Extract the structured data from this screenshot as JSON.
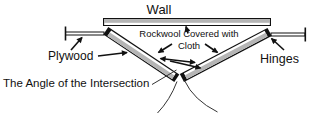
{
  "diagram": {
    "labels": {
      "wall": "Wall",
      "plywood": "Plywood",
      "rockwool_line1": "Rockwool Covered with",
      "rockwool_line2": "Cloth",
      "hinges": "Hinges",
      "angle_of_intersection": "The Angle of the Intersection"
    }
  },
  "colors": {
    "panel_fill": "#b5b5b5",
    "line": "#111111",
    "background": "#ffffff",
    "text": "#111111"
  }
}
